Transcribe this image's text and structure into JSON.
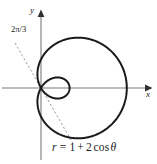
{
  "figure": {
    "background_color": "#ffffff",
    "curve_color": "#1a1a1a",
    "axis_color": "#7a7a7a",
    "dashed_ray_color": "#9a9a9a",
    "width": 157,
    "height": 164
  },
  "axes": {
    "x_label": "x",
    "y_label": "y",
    "origin_px": {
      "x": 41,
      "y": 88
    },
    "scale_px_per_unit": 28.6
  },
  "annotations": {
    "angle_label": "2π/3",
    "equation": "r = 1 + 2 cos θ",
    "equation_parts": {
      "r": "r",
      "equals": "=",
      "one": "1",
      "plus": "+",
      "two": "2",
      "cos": "cos",
      "theta": "θ"
    }
  },
  "chart_data": {
    "type": "line",
    "title": "",
    "subtitle": "",
    "xlabel": "x",
    "ylabel": "y",
    "plot_kind": "polar-limacon-with-inner-loop",
    "equation": "r = 1 + 2 cos θ",
    "polar_form": {
      "a": 1,
      "b": 2,
      "function": "cos"
    },
    "theta_range_rad": [
      0,
      6.283185307179586
    ],
    "grid": false,
    "legend": null,
    "annotations": [
      {
        "text": "2π/3",
        "kind": "ray-angle-label",
        "angle_rad": 2.0943951023931953,
        "angle_deg": 120,
        "style": "dashed",
        "note": "dashed line through origin at theta = 2pi/3, the inner-loop tangent direction"
      }
    ],
    "key_points": [
      {
        "label": "theta=0 (max r, rightmost)",
        "theta_deg": 0,
        "r": 3,
        "x": 3,
        "y": 0
      },
      {
        "label": "theta=90",
        "theta_deg": 90,
        "r": 1,
        "x": 0,
        "y": 1
      },
      {
        "label": "theta=120 (r=0, origin)",
        "theta_deg": 120,
        "r": 0,
        "x": 0,
        "y": 0
      },
      {
        "label": "theta=180 (inner loop tip)",
        "theta_deg": 180,
        "r": -1,
        "x": 1,
        "y": 0
      },
      {
        "label": "theta=240 (r=0, origin)",
        "theta_deg": 240,
        "r": 0,
        "x": 0,
        "y": 0
      },
      {
        "label": "theta=270",
        "theta_deg": 270,
        "r": 1,
        "x": 0,
        "y": -1
      }
    ],
    "xlim": [
      -1.45,
      4.05
    ],
    "ylim": [
      -1.95,
      2.9
    ],
    "x_ticks": [],
    "y_ticks": []
  }
}
